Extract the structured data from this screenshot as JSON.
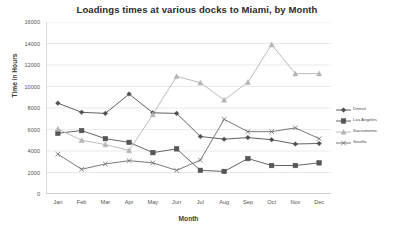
{
  "chart_data": {
    "type": "line",
    "title": "Loadings times at various docks to Miami, by Month",
    "xlabel": "Month",
    "ylabel": "Time in Hours",
    "categories": [
      "Jan",
      "Feb",
      "Mar",
      "Apr",
      "May",
      "Jun",
      "Jul",
      "Aug",
      "Sep",
      "Oct",
      "Nov",
      "Dec"
    ],
    "ylim": [
      0,
      16000
    ],
    "ytick_labels": [
      "0",
      "2000",
      "4000",
      "6000",
      "8000",
      "10000",
      "12000",
      "14000",
      "16000"
    ],
    "ytick_values": [
      0,
      2000,
      4000,
      6000,
      8000,
      10000,
      12000,
      14000,
      16000
    ],
    "grid": true,
    "legend_position": "right",
    "series": [
      {
        "name": "Detroit",
        "color": "#4f4f4f",
        "marker": "diamond",
        "values": [
          8450,
          7600,
          7500,
          9300,
          7550,
          7500,
          5350,
          5100,
          5250,
          5050,
          4650,
          4700
        ]
      },
      {
        "name": "Los Angeles",
        "color": "#555555",
        "marker": "square",
        "values": [
          5650,
          5900,
          5150,
          4800,
          3850,
          4200,
          2200,
          2100,
          3300,
          2650,
          2650,
          2900
        ]
      },
      {
        "name": "Sacramento",
        "color": "#b4b4b4",
        "marker": "triangle",
        "values": [
          6050,
          5000,
          4600,
          4050,
          7400,
          10950,
          10350,
          8750,
          10400,
          13900,
          11200,
          11200
        ]
      },
      {
        "name": "Seattle",
        "color": "#6b6b6b",
        "marker": "cross",
        "values": [
          3700,
          2300,
          2800,
          3100,
          2900,
          2200,
          3150,
          6950,
          5800,
          5800,
          6150,
          5150
        ]
      }
    ]
  },
  "sacramento_note": {
    "values_ordered": [
      6050,
      5000,
      4600,
      4050,
      7400,
      10950,
      10350,
      8750,
      10400,
      13900,
      11200
    ]
  }
}
